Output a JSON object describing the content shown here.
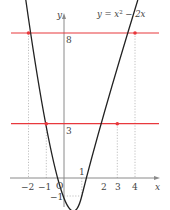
{
  "diagram": {
    "function_label": "y = x² − 2x",
    "function_label_parts": {
      "y": "y",
      "eq": " = ",
      "x": "x",
      "exp": "2",
      "rest": " − 2x"
    },
    "axis_labels": {
      "x": "x",
      "y": "y",
      "origin": "O"
    },
    "x_ticks": [
      {
        "value": -2,
        "label": "−2"
      },
      {
        "value": -1,
        "label": "−1"
      },
      {
        "value": 1,
        "label": "1"
      },
      {
        "value": 2,
        "label": "2"
      },
      {
        "value": 3,
        "label": "3"
      },
      {
        "value": 4,
        "label": "4"
      }
    ],
    "y_ticks": [
      {
        "value": 8,
        "label": "8"
      },
      {
        "value": 3,
        "label": "3"
      },
      {
        "value": -1,
        "label": "−1"
      }
    ],
    "horizontal_lines": [
      {
        "y": 8,
        "color": "#e8383d",
        "intersections": [
          -2,
          4
        ]
      },
      {
        "y": 3,
        "color": "#e8383d",
        "intersections": [
          -1,
          3
        ]
      }
    ],
    "vertex": {
      "x": 1,
      "y": -1
    },
    "colors": {
      "curve": "#222222",
      "axes": "#888888",
      "guides": "#aaaaaa",
      "highlight": "#e8383d"
    }
  }
}
